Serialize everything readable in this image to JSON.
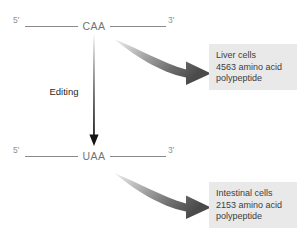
{
  "figure": {
    "process_label": "Editing"
  },
  "strands": {
    "top": {
      "five_prime": "5'",
      "three_prime": "3'",
      "codon": "CAA"
    },
    "bottom": {
      "five_prime": "5'",
      "three_prime": "3'",
      "codon": "UAA"
    }
  },
  "results": {
    "liver": {
      "cell_type": "Liver cells",
      "length": "4563 amino acid",
      "product": "polypeptide"
    },
    "intestinal": {
      "cell_type": "Intestinal cells",
      "length": "2153 amino acid",
      "product": "polypeptide"
    }
  },
  "colors": {
    "strand_line": "#8a8a8a",
    "codon_text": "#737373",
    "box_background": "#e9e9e9",
    "box_text": "#3d3d3d",
    "arrow_dark": "#2b2b2b",
    "arrow_light": "#d8d8d8"
  }
}
